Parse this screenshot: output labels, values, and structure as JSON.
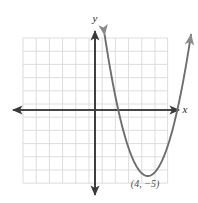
{
  "figure": {
    "kind": "coordinate-plane-graph",
    "background_color": "#ffffff"
  },
  "axes": {
    "x_label": "x",
    "y_label": "y",
    "axis_color": "#3a3a3a",
    "grid_color": "#d9d9d9",
    "grid_columns": 11,
    "grid_rows": 11,
    "origin_px": [
      95,
      110
    ],
    "unit_px": 13.2,
    "x_range": [
      -5.45,
      5.53
    ],
    "y_range": [
      -5.53,
      5.45
    ],
    "ticks_shown": false,
    "tick_numbers_shown": false
  },
  "annotations": [
    {
      "name": "vertex-label",
      "text": "(4, −5)",
      "x_value": 4,
      "y_value": -5,
      "color": "#4a4a4a"
    }
  ],
  "chart_data": {
    "type": "line",
    "title": "",
    "xlabel": "x",
    "ylabel": "y",
    "xlim": [
      -5.45,
      5.53
    ],
    "ylim": [
      -5.53,
      5.45
    ],
    "grid": true,
    "legend": null,
    "series": [
      {
        "name": "parabola",
        "curve": "quadratic",
        "color": "#6e6e6e",
        "vertex": [
          4,
          -5
        ],
        "leading_coefficient": 1,
        "equation": "y = (x - 4)^2 - 5",
        "roots": [
          1.76,
          6.24
        ],
        "arrow_ends": [
          "up-left",
          "up-right"
        ],
        "x": [
          1.0,
          1.3,
          1.6,
          1.9,
          2.2,
          2.5,
          2.8,
          3.1,
          3.4,
          3.7,
          4.0,
          4.3,
          4.6,
          4.9,
          5.2,
          5.5
        ],
        "y": [
          4.0,
          2.29,
          0.76,
          -0.59,
          -1.76,
          -2.75,
          -3.56,
          -4.19,
          -4.64,
          -4.91,
          -5.0,
          -4.91,
          -4.64,
          -4.19,
          -3.56,
          -2.75
        ]
      }
    ],
    "annotations": [
      {
        "text": "(4, −5)",
        "x": 4,
        "y": -5
      }
    ]
  }
}
